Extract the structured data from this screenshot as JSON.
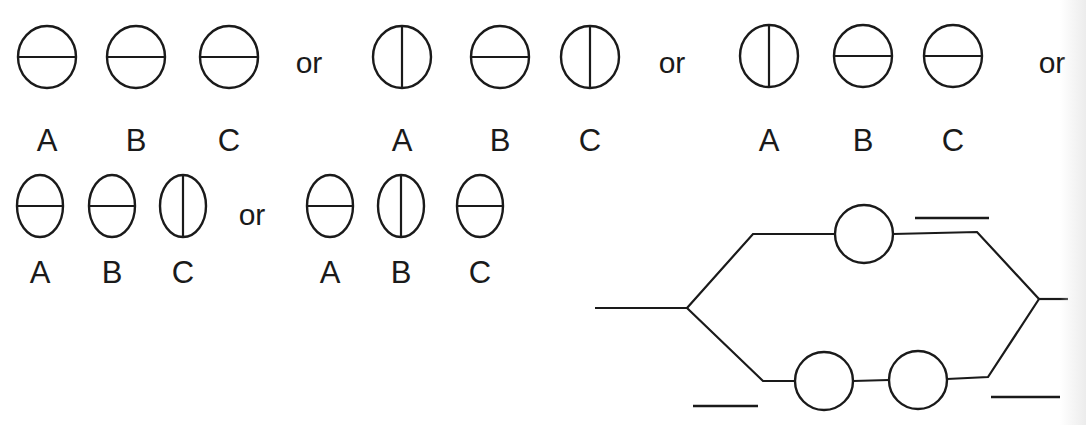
{
  "connector": "or",
  "option_groups": [
    {
      "row": 1,
      "items": [
        {
          "label": "A",
          "line": "horizontal",
          "cx": 47,
          "cy": 57
        },
        {
          "label": "B",
          "line": "horizontal",
          "cx": 136,
          "cy": 57
        },
        {
          "label": "C",
          "line": "horizontal",
          "cx": 229,
          "cy": 57
        }
      ],
      "or_x": 309,
      "or_y": 63,
      "label_y": 140,
      "rx": 29,
      "ry": 31
    },
    {
      "row": 1,
      "items": [
        {
          "label": "A",
          "line": "vertical",
          "cx": 402,
          "cy": 57
        },
        {
          "label": "B",
          "line": "horizontal",
          "cx": 500,
          "cy": 57
        },
        {
          "label": "C",
          "line": "vertical",
          "cx": 590,
          "cy": 57
        }
      ],
      "or_x": 672,
      "or_y": 63,
      "label_y": 140,
      "rx": 29,
      "ry": 31
    },
    {
      "row": 1,
      "items": [
        {
          "label": "A",
          "line": "vertical",
          "cx": 769,
          "cy": 56
        },
        {
          "label": "B",
          "line": "horizontal",
          "cx": 863,
          "cy": 56
        },
        {
          "label": "C",
          "line": "horizontal",
          "cx": 953,
          "cy": 56
        }
      ],
      "or_x": 1052,
      "or_y": 63,
      "label_y": 140,
      "rx": 29,
      "ry": 31
    },
    {
      "row": 2,
      "items": [
        {
          "label": "A",
          "line": "horizontal",
          "cx": 40,
          "cy": 206
        },
        {
          "label": "B",
          "line": "horizontal",
          "cx": 112,
          "cy": 206
        },
        {
          "label": "C",
          "line": "vertical",
          "cx": 183,
          "cy": 206
        }
      ],
      "or_x": 252,
      "or_y": 215,
      "label_y": 272,
      "rx": 23,
      "ry": 31
    },
    {
      "row": 2,
      "items": [
        {
          "label": "A",
          "line": "horizontal",
          "cx": 330,
          "cy": 206
        },
        {
          "label": "B",
          "line": "vertical",
          "cx": 401,
          "cy": 206
        },
        {
          "label": "C",
          "line": "horizontal",
          "cx": 480,
          "cy": 206
        }
      ],
      "or_x": null,
      "or_y": null,
      "label_y": 272,
      "rx": 23,
      "ry": 31
    }
  ],
  "circuit": {
    "input_wire": [
      [
        595,
        308
      ],
      [
        687,
        308
      ]
    ],
    "upper_branch": [
      [
        687,
        308
      ],
      [
        753,
        234
      ],
      [
        835,
        234
      ]
    ],
    "upper_branch_out": [
      [
        893,
        234
      ],
      [
        977,
        232
      ],
      [
        1039,
        299
      ]
    ],
    "upper_slot": {
      "cx": 864,
      "cy": 234,
      "r": 29
    },
    "lower_branch_in": [
      [
        687,
        308
      ],
      [
        763,
        381
      ],
      [
        795,
        381
      ]
    ],
    "lower_mid": [
      [
        853,
        381
      ],
      [
        889,
        380
      ]
    ],
    "lower_branch_out": [
      [
        947,
        379
      ],
      [
        988,
        377
      ],
      [
        1039,
        299
      ]
    ],
    "lower_slots": [
      {
        "cx": 824,
        "cy": 381,
        "r": 29
      },
      {
        "cx": 918,
        "cy": 380,
        "r": 29
      }
    ],
    "output_wire": [
      [
        1039,
        299
      ],
      [
        1068,
        299
      ]
    ],
    "answer_blanks": [
      {
        "id": "blank-top",
        "x1": 915,
        "y1": 218,
        "x2": 989,
        "y2": 218
      },
      {
        "id": "blank-bottom-left",
        "x1": 693,
        "y1": 406,
        "x2": 758,
        "y2": 406
      },
      {
        "id": "blank-bottom-right",
        "x1": 991,
        "y1": 397,
        "x2": 1060,
        "y2": 397
      }
    ]
  },
  "colors": {
    "stroke": "#1a1a1a",
    "background": "#ffffff"
  }
}
